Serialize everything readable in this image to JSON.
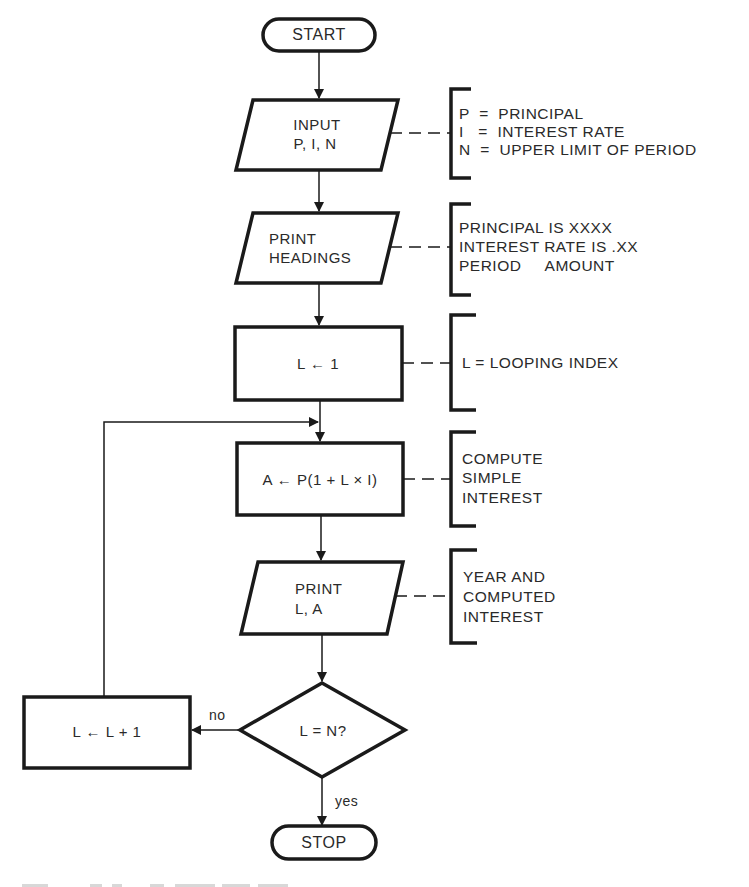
{
  "diagram": {
    "type": "flowchart",
    "nodes": [
      {
        "id": "start",
        "shape": "terminal",
        "lines": [
          "START"
        ]
      },
      {
        "id": "input",
        "shape": "parallelogram",
        "lines": [
          "INPUT",
          "P, I, N"
        ],
        "annotation": [
          "P  =  PRINCIPAL",
          "I   =  INTEREST RATE",
          "N  =  UPPER LIMIT OF PERIOD"
        ]
      },
      {
        "id": "headings",
        "shape": "parallelogram",
        "lines": [
          "PRINT",
          "HEADINGS"
        ],
        "annotation": [
          "PRINCIPAL IS XXXX",
          "INTEREST RATE IS .XX",
          "PERIOD     AMOUNT"
        ]
      },
      {
        "id": "init",
        "shape": "rectangle",
        "lines": [
          "L ← 1"
        ],
        "annotation": [
          "L = LOOPING INDEX"
        ]
      },
      {
        "id": "compute",
        "shape": "rectangle",
        "lines": [
          "A ← P(1 + L × I)"
        ],
        "annotation": [
          "COMPUTE",
          "SIMPLE",
          "INTEREST"
        ]
      },
      {
        "id": "print",
        "shape": "parallelogram",
        "lines": [
          "PRINT",
          "L, A"
        ],
        "annotation": [
          "YEAR AND",
          "COMPUTED",
          "INTEREST"
        ]
      },
      {
        "id": "decision",
        "shape": "diamond",
        "lines": [
          "L = N?"
        ]
      },
      {
        "id": "increment",
        "shape": "rectangle",
        "lines": [
          "L ← L + 1"
        ]
      },
      {
        "id": "stop",
        "shape": "terminal",
        "lines": [
          "STOP"
        ]
      }
    ],
    "edges": [
      {
        "from": "start",
        "to": "input"
      },
      {
        "from": "input",
        "to": "headings"
      },
      {
        "from": "headings",
        "to": "init"
      },
      {
        "from": "init",
        "to": "compute"
      },
      {
        "from": "compute",
        "to": "print"
      },
      {
        "from": "print",
        "to": "decision"
      },
      {
        "from": "decision",
        "to": "increment",
        "label": "no"
      },
      {
        "from": "increment",
        "to": "compute"
      },
      {
        "from": "decision",
        "to": "stop",
        "label": "yes"
      }
    ],
    "edge_labels": {
      "no": "no",
      "yes": "yes"
    }
  },
  "colors": {
    "ink": "#1a1a1a",
    "background": "#ffffff"
  }
}
